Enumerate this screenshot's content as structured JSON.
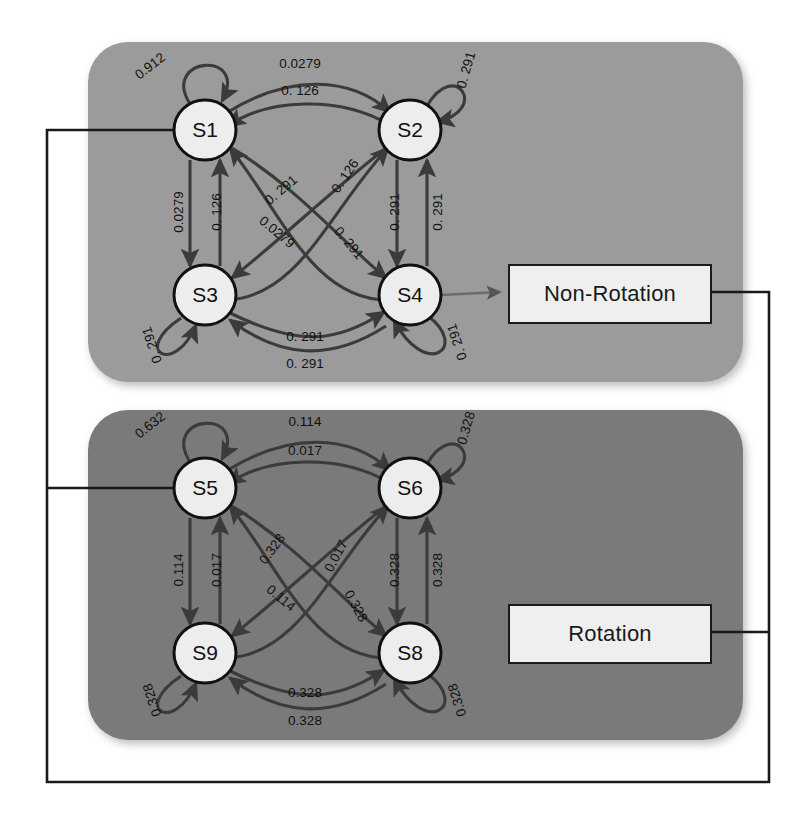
{
  "figure": {
    "background_color": "#ffffff"
  },
  "panels": [
    {
      "id": "non-rotation-panel",
      "fill": "#9b9b9b",
      "states": [
        "S1",
        "S2",
        "S3",
        "S4"
      ],
      "output_label": "Non-Rotation"
    },
    {
      "id": "rotation-panel",
      "fill": "#7a7a7a",
      "states": [
        "S5",
        "S6",
        "S9",
        "S8"
      ],
      "output_label": "Rotation"
    }
  ],
  "boxes": {
    "non_rotation": "Non-Rotation",
    "rotation": "Rotation"
  },
  "nodes": [
    {
      "id": "S1",
      "label": "S1",
      "cx": 205,
      "cy": 130
    },
    {
      "id": "S2",
      "label": "S2",
      "cx": 410,
      "cy": 130
    },
    {
      "id": "S3",
      "label": "S3",
      "cx": 205,
      "cy": 295
    },
    {
      "id": "S4",
      "label": "S4",
      "cx": 410,
      "cy": 295
    },
    {
      "id": "S5",
      "label": "S5",
      "cx": 205,
      "cy": 488
    },
    {
      "id": "S6",
      "label": "S6",
      "cx": 410,
      "cy": 488
    },
    {
      "id": "S9",
      "label": "S9",
      "cx": 205,
      "cy": 653
    },
    {
      "id": "S8",
      "label": "S8",
      "cx": 410,
      "cy": 653
    }
  ],
  "edge_labels": [
    {
      "id": "l-s1-self",
      "text": "0.912",
      "x": 150,
      "y": 66,
      "rot": -38
    },
    {
      "id": "l-s1-s2",
      "text": "0.0279",
      "x": 300,
      "y": 63,
      "rot": 0
    },
    {
      "id": "l-s2-s1",
      "text": "0. 126",
      "x": 300,
      "y": 90,
      "rot": 0
    },
    {
      "id": "l-s2-self",
      "text": "0. 291",
      "x": 466,
      "y": 70,
      "rot": -74
    },
    {
      "id": "l-s1-s3",
      "text": "0.0279",
      "x": 178,
      "y": 212,
      "rot": -90
    },
    {
      "id": "l-s3-s1",
      "text": "0. 126",
      "x": 216,
      "y": 212,
      "rot": -90
    },
    {
      "id": "l-s2-s4",
      "text": "0. 291",
      "x": 394,
      "y": 212,
      "rot": -90
    },
    {
      "id": "l-s4-s2",
      "text": "0. 291",
      "x": 437,
      "y": 212,
      "rot": -90
    },
    {
      "id": "l-diag-a",
      "text": "0. 291",
      "x": 281,
      "y": 190,
      "rot": -40
    },
    {
      "id": "l-diag-b",
      "text": "0. 126",
      "x": 345,
      "y": 176,
      "rot": -56
    },
    {
      "id": "l-diag-c",
      "text": "0.0279",
      "x": 277,
      "y": 232,
      "rot": 40
    },
    {
      "id": "l-diag-d",
      "text": "0. 291",
      "x": 349,
      "y": 243,
      "rot": 50
    },
    {
      "id": "l-s3-self",
      "text": "0. 291",
      "x": 152,
      "y": 345,
      "rot": -108
    },
    {
      "id": "l-s4-self",
      "text": "0. 291",
      "x": 457,
      "y": 342,
      "rot": -108
    },
    {
      "id": "l-s3-s4",
      "text": "0. 291",
      "x": 305,
      "y": 336,
      "rot": 0
    },
    {
      "id": "l-s4-s3",
      "text": "0. 291",
      "x": 305,
      "y": 363,
      "rot": 0
    },
    {
      "id": "l-s5-self",
      "text": "0.632",
      "x": 150,
      "y": 425,
      "rot": -38
    },
    {
      "id": "l-s5-s6",
      "text": "0.114",
      "x": 305,
      "y": 421,
      "rot": 0
    },
    {
      "id": "l-s6-s5",
      "text": "0.017",
      "x": 305,
      "y": 450,
      "rot": 0
    },
    {
      "id": "l-s6-self",
      "text": "0.328",
      "x": 466,
      "y": 428,
      "rot": -74
    },
    {
      "id": "l-s5-s9",
      "text": "0.114",
      "x": 178,
      "y": 570,
      "rot": -90
    },
    {
      "id": "l-s9-s5",
      "text": "0.017",
      "x": 216,
      "y": 570,
      "rot": -90
    },
    {
      "id": "l-s6-s8",
      "text": "0.328",
      "x": 394,
      "y": 570,
      "rot": -90
    },
    {
      "id": "l-s8-s6",
      "text": "0.328",
      "x": 437,
      "y": 570,
      "rot": -90
    },
    {
      "id": "l-diag-e",
      "text": "0.328",
      "x": 272,
      "y": 549,
      "rot": -54
    },
    {
      "id": "l-diag-f",
      "text": "0.017",
      "x": 336,
      "y": 556,
      "rot": -62
    },
    {
      "id": "l-diag-g",
      "text": "0.114",
      "x": 281,
      "y": 598,
      "rot": 40
    },
    {
      "id": "l-diag-h",
      "text": "0.328",
      "x": 356,
      "y": 606,
      "rot": 62
    },
    {
      "id": "l-s9-self",
      "text": "0.328",
      "x": 152,
      "y": 700,
      "rot": -108
    },
    {
      "id": "l-s8-self",
      "text": "0.328",
      "x": 457,
      "y": 700,
      "rot": -108
    },
    {
      "id": "l-s9-s8",
      "text": "0.328",
      "x": 305,
      "y": 692,
      "rot": 0
    },
    {
      "id": "l-s8-s9",
      "text": "0.328",
      "x": 305,
      "y": 720,
      "rot": 0
    }
  ],
  "chart_data": {
    "type": "diagram",
    "regimes": [
      {
        "name": "Non-Rotation",
        "states": [
          "S1",
          "S2",
          "S3",
          "S4"
        ],
        "transitions": [
          {
            "from": "S1",
            "to": "S1",
            "probability": 0.912
          },
          {
            "from": "S1",
            "to": "S2",
            "probability": 0.0279
          },
          {
            "from": "S2",
            "to": "S1",
            "probability": 0.126
          },
          {
            "from": "S2",
            "to": "S2",
            "probability": 0.291
          },
          {
            "from": "S1",
            "to": "S3",
            "probability": 0.0279
          },
          {
            "from": "S3",
            "to": "S1",
            "probability": 0.126
          },
          {
            "from": "S2",
            "to": "S4",
            "probability": 0.291
          },
          {
            "from": "S4",
            "to": "S2",
            "probability": 0.291
          },
          {
            "from": "S3",
            "to": "S2",
            "probability": 0.291
          },
          {
            "from": "S4",
            "to": "S1",
            "probability": 0.126
          },
          {
            "from": "S1",
            "to": "S4",
            "probability": 0.0279
          },
          {
            "from": "S2",
            "to": "S3",
            "probability": 0.291
          },
          {
            "from": "S3",
            "to": "S3",
            "probability": 0.291
          },
          {
            "from": "S4",
            "to": "S4",
            "probability": 0.291
          },
          {
            "from": "S3",
            "to": "S4",
            "probability": 0.291
          },
          {
            "from": "S4",
            "to": "S3",
            "probability": 0.291
          }
        ]
      },
      {
        "name": "Rotation",
        "states": [
          "S5",
          "S6",
          "S9",
          "S8"
        ],
        "transitions": [
          {
            "from": "S5",
            "to": "S5",
            "probability": 0.632
          },
          {
            "from": "S5",
            "to": "S6",
            "probability": 0.114
          },
          {
            "from": "S6",
            "to": "S5",
            "probability": 0.017
          },
          {
            "from": "S6",
            "to": "S6",
            "probability": 0.328
          },
          {
            "from": "S5",
            "to": "S9",
            "probability": 0.114
          },
          {
            "from": "S9",
            "to": "S5",
            "probability": 0.017
          },
          {
            "from": "S6",
            "to": "S8",
            "probability": 0.328
          },
          {
            "from": "S8",
            "to": "S6",
            "probability": 0.328
          },
          {
            "from": "S9",
            "to": "S6",
            "probability": 0.328
          },
          {
            "from": "S8",
            "to": "S5",
            "probability": 0.017
          },
          {
            "from": "S5",
            "to": "S8",
            "probability": 0.114
          },
          {
            "from": "S6",
            "to": "S9",
            "probability": 0.328
          },
          {
            "from": "S9",
            "to": "S9",
            "probability": 0.328
          },
          {
            "from": "S8",
            "to": "S8",
            "probability": 0.328
          },
          {
            "from": "S9",
            "to": "S8",
            "probability": 0.328
          },
          {
            "from": "S8",
            "to": "S9",
            "probability": 0.328
          }
        ]
      }
    ],
    "outputs": [
      {
        "from_state": "S4",
        "to_box": "Non-Rotation"
      },
      {
        "from_box": "Rotation",
        "feedback_to": "S5"
      }
    ]
  }
}
